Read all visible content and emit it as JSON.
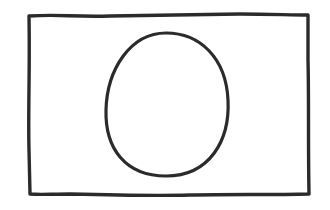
{
  "canvas": {
    "width": 330,
    "height": 210,
    "background": "#ffffff"
  },
  "stroke": {
    "color": "#2b2b2b",
    "width": 3.2
  },
  "shapes": [
    {
      "type": "rectangle",
      "name": "outer-frame",
      "x": 28,
      "y": 15,
      "width": 281,
      "height": 180
    },
    {
      "type": "oval",
      "name": "egg",
      "cx": 167,
      "cy": 104,
      "rx": 63,
      "ry": 72
    }
  ]
}
